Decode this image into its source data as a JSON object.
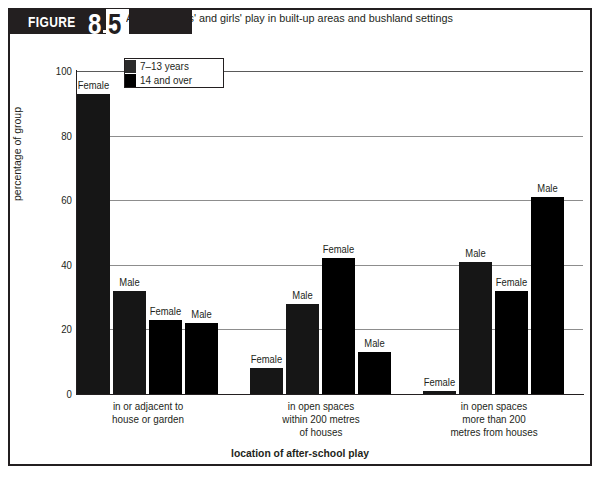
{
  "figure": {
    "label_word": "FIGURE",
    "number_major": "8",
    "number_minor": "5",
    "caption": "Adelaide boys' and girls' play in built-up areas and bushland settings"
  },
  "legend": {
    "items": [
      {
        "label": "7–13 years",
        "swatch": "dark-grey"
      },
      {
        "label": "14 and over",
        "swatch": "black"
      }
    ]
  },
  "chart_data": {
    "type": "bar",
    "title": "Adelaide boys' and girls' play in built-up areas and bushland settings",
    "xlabel": "location of after-school play",
    "ylabel": "percentage of group",
    "ylim": [
      0,
      100
    ],
    "yticks": [
      "0",
      "20",
      "40",
      "60",
      "80",
      "100"
    ],
    "grid": "horizontal",
    "legend_position": "top-left-inside",
    "categories": [
      "in or adjacent to house or garden",
      "in open spaces within 200 metres of houses",
      "in open spaces more than 200 metres from houses"
    ],
    "category_lines": [
      [
        "in or adjacent to",
        "house or garden"
      ],
      [
        "in open spaces",
        "within 200 metres",
        "of houses"
      ],
      [
        "in open spaces",
        "more than 200",
        "metres from houses"
      ]
    ],
    "series": [
      {
        "name": "7–13 years female",
        "age": "7–13 years",
        "sex": "Female",
        "values": [
          93,
          8,
          1
        ]
      },
      {
        "name": "7–13 years male",
        "age": "7–13 years",
        "sex": "Male",
        "values": [
          32,
          28,
          41
        ]
      },
      {
        "name": "14 and over female",
        "age": "14 and over",
        "sex": "Female",
        "values": [
          23,
          42,
          32
        ]
      },
      {
        "name": "14 and over male",
        "age": "14 and over",
        "sex": "Male",
        "values": [
          22,
          13,
          61
        ]
      }
    ],
    "bars": [
      {
        "group": 0,
        "index": 0,
        "sex_label": "Female",
        "age": "7–13 years",
        "value": 93
      },
      {
        "group": 0,
        "index": 1,
        "sex_label": "Male",
        "age": "7–13 years",
        "value": 32
      },
      {
        "group": 0,
        "index": 2,
        "sex_label": "Female",
        "age": "14 and over",
        "value": 23
      },
      {
        "group": 0,
        "index": 3,
        "sex_label": "Male",
        "age": "14 and over",
        "value": 22
      },
      {
        "group": 1,
        "index": 0,
        "sex_label": "Female",
        "age": "7–13 years",
        "value": 8
      },
      {
        "group": 1,
        "index": 1,
        "sex_label": "Male",
        "age": "7–13 years",
        "value": 28
      },
      {
        "group": 1,
        "index": 2,
        "sex_label": "Female",
        "age": "14 and over",
        "value": 42
      },
      {
        "group": 1,
        "index": 3,
        "sex_label": "Male",
        "age": "14 and over",
        "value": 13
      },
      {
        "group": 2,
        "index": 0,
        "sex_label": "Female",
        "age": "7–13 years",
        "value": 1
      },
      {
        "group": 2,
        "index": 1,
        "sex_label": "Male",
        "age": "7–13 years",
        "value": 41
      },
      {
        "group": 2,
        "index": 2,
        "sex_label": "Female",
        "age": "14 and over",
        "value": 32
      },
      {
        "group": 2,
        "index": 3,
        "sex_label": "Male",
        "age": "14 and over",
        "value": 61
      }
    ]
  },
  "colors": {
    "ink": "#231f20",
    "bar_young": "#161616",
    "bar_old": "#000000",
    "gridline": "#8d8d8d",
    "background": "#ffffff"
  }
}
